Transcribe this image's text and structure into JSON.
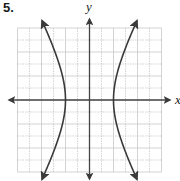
{
  "problem": {
    "number": "5."
  },
  "axes": {
    "x_label": "x",
    "y_label": "y"
  },
  "grid": {
    "origin_px": [
      89.5,
      100
    ],
    "unit_px": 12,
    "x_range": [
      -6,
      6
    ],
    "y_range": [
      -6,
      6
    ],
    "line_color": "#c8c8c8",
    "axis_color": "#444444",
    "curve_color": "#3a3a3a"
  },
  "chart_data": {
    "type": "line",
    "title": "",
    "equation_estimate": "x^2/4 - y^2/15 = 1",
    "vertices": [
      [
        -2,
        0
      ],
      [
        2,
        0
      ]
    ],
    "xlabel": "x",
    "ylabel": "y",
    "xlim": [
      -6,
      6
    ],
    "ylim": [
      -6,
      6
    ],
    "grid": true,
    "series": [
      {
        "name": "left branch",
        "points": [
          [
            -3.96,
            6.6
          ],
          [
            -3.0,
            4.3
          ],
          [
            -2.5,
            2.9
          ],
          [
            -2.0,
            0
          ],
          [
            -2.5,
            -2.9
          ],
          [
            -3.0,
            -4.3
          ],
          [
            -3.96,
            -6.6
          ]
        ]
      },
      {
        "name": "right branch",
        "points": [
          [
            3.96,
            6.6
          ],
          [
            3.0,
            4.3
          ],
          [
            2.5,
            2.9
          ],
          [
            2.0,
            0
          ],
          [
            2.5,
            -2.9
          ],
          [
            3.0,
            -4.3
          ],
          [
            3.96,
            -6.6
          ]
        ]
      }
    ]
  }
}
